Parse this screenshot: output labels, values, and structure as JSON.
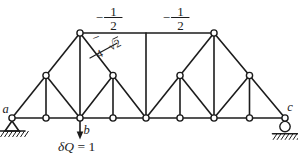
{
  "figure": {
    "background": "#ffffff",
    "ink": "#1c1c1c",
    "kind": "truss-diagram"
  },
  "force_labels": {
    "top_chord_left": {
      "sign": "−",
      "numerator": "1",
      "denominator": "2"
    },
    "top_chord_right": {
      "sign": "−",
      "numerator": "1",
      "denominator": "2"
    },
    "diagonal": {
      "sign": "−",
      "numerator": "√2",
      "denominator": "4"
    }
  },
  "point_labels": {
    "left_support": "a",
    "load_point": "b",
    "right_support": "c"
  },
  "load": {
    "at": "b",
    "symbol": "δQ",
    "equation_rest": " = 1"
  },
  "truss": {
    "nodes": [
      {
        "id": "a",
        "x": 12,
        "y": 118
      },
      {
        "id": "n2",
        "x": 46,
        "y": 118
      },
      {
        "id": "b",
        "x": 80,
        "y": 118
      },
      {
        "id": "n4",
        "x": 113,
        "y": 118
      },
      {
        "id": "n5",
        "x": 146,
        "y": 118
      },
      {
        "id": "n6",
        "x": 180,
        "y": 118
      },
      {
        "id": "n7",
        "x": 214,
        "y": 118
      },
      {
        "id": "n8",
        "x": 249.5,
        "y": 118
      },
      {
        "id": "c",
        "x": 285,
        "y": 118
      },
      {
        "id": "m1",
        "x": 46,
        "y": 75.5
      },
      {
        "id": "m2",
        "x": 113,
        "y": 75.5
      },
      {
        "id": "m3",
        "x": 180,
        "y": 75.5
      },
      {
        "id": "m4",
        "x": 249.5,
        "y": 75.5
      },
      {
        "id": "p1",
        "x": 80,
        "y": 33
      },
      {
        "id": "p2",
        "x": 214,
        "y": 33
      },
      {
        "id": "t0",
        "x": 146,
        "y": 33,
        "joint": false
      }
    ],
    "members": [
      [
        "a",
        "c"
      ],
      [
        "a",
        "p1"
      ],
      [
        "p1",
        "n5"
      ],
      [
        "n5",
        "p2"
      ],
      [
        "p2",
        "c"
      ],
      [
        "p1",
        "p2"
      ],
      [
        "t0",
        "n5"
      ],
      [
        "p1",
        "b"
      ],
      [
        "p2",
        "n7"
      ],
      [
        "m1",
        "n2"
      ],
      [
        "m2",
        "n4"
      ],
      [
        "m3",
        "n6"
      ],
      [
        "m4",
        "n8"
      ],
      [
        "m1",
        "b"
      ],
      [
        "m2",
        "b"
      ],
      [
        "m3",
        "n7"
      ],
      [
        "m4",
        "n7"
      ]
    ],
    "supports": [
      {
        "at": "a",
        "type": "pin"
      },
      {
        "at": "c",
        "type": "roller"
      }
    ]
  }
}
